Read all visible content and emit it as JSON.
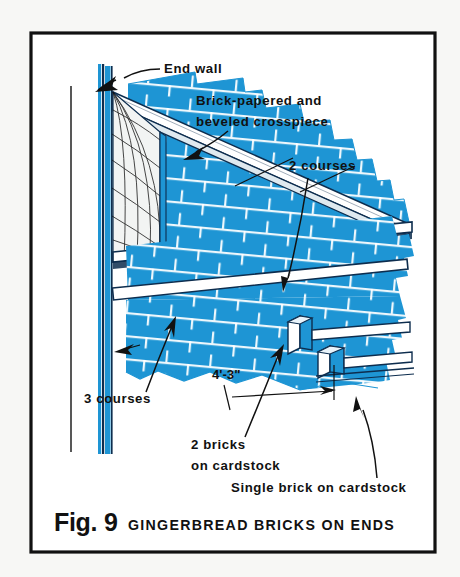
{
  "figure": {
    "frame_color": "#111111",
    "background_color": "#f7f7f5",
    "paper_color": "#ffffff",
    "brick_blue": "#1e95d4",
    "brick_blue_dark": "#0d6ea8",
    "outline_navy": "#0d2d4e",
    "mortar_color": "#ffffff",
    "text_color": "#111111"
  },
  "caption": {
    "fig_number": "Fig. 9",
    "title": "GINGERBREAD BRICKS ON ENDS"
  },
  "labels": {
    "end_wall": "End wall",
    "crosspiece_line1": "Brick-papered and",
    "crosspiece_line2": "beveled crosspiece",
    "two_courses": "2 courses",
    "three_courses": "3 courses",
    "dimension": "4'-3\"",
    "two_bricks_line1": "2 bricks",
    "two_bricks_line2": "on cardstock",
    "single_brick": "Single brick on cardstock"
  },
  "diagram": {
    "course_group_top": 2,
    "course_group_bottom": 3,
    "measured_span": "4'-3\"",
    "projecting_blocks": [
      "2 bricks on cardstock",
      "single brick on cardstock"
    ],
    "elements": [
      "end-wall-vertical-edge",
      "lattice-mesh-panel",
      "beveled-crosspiece-band",
      "upper-brick-field",
      "middle-brick-field",
      "lower-brick-field",
      "stepped-projecting-bricks",
      "torn-edge-right",
      "torn-edge-bottom",
      "reference-line-left"
    ]
  }
}
